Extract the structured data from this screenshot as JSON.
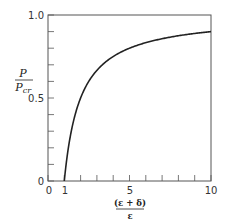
{
  "chart_data": {
    "type": "line",
    "title": "",
    "xlabel": "(ε + δ) / ε",
    "ylabel": "P / P_cr",
    "xlim": [
      0,
      10
    ],
    "ylim": [
      0,
      1.0
    ],
    "grid": false,
    "legend": null,
    "x_ticks": [
      0,
      1,
      2,
      3,
      4,
      5,
      6,
      7,
      8,
      9,
      10
    ],
    "x_tick_labels": [
      "0",
      "1",
      "5",
      "10"
    ],
    "y_ticks": [
      0,
      0.1,
      0.2,
      0.3,
      0.4,
      0.5,
      0.6,
      0.7,
      0.8,
      0.9,
      1.0
    ],
    "y_tick_labels": [
      "0",
      "0.5",
      "1.0"
    ],
    "series": [
      {
        "name": "P/Pcr = 1 - 1/x",
        "x": [
          1,
          1.25,
          1.5,
          2,
          2.5,
          3,
          4,
          5,
          6,
          7,
          8,
          9,
          10
        ],
        "y": [
          0,
          0.2,
          0.333,
          0.5,
          0.6,
          0.667,
          0.75,
          0.8,
          0.833,
          0.857,
          0.875,
          0.889,
          0.9
        ]
      }
    ]
  },
  "labels": {
    "y_num": "P",
    "y_den": "P",
    "y_den_sub": "cr",
    "x_num": "(ε + δ)",
    "x_den": "ε",
    "xt0": "0",
    "xt1": "1",
    "xt5": "5",
    "xt10": "10",
    "yt0": "0",
    "yt05": "0.5",
    "yt10": "1.0"
  }
}
